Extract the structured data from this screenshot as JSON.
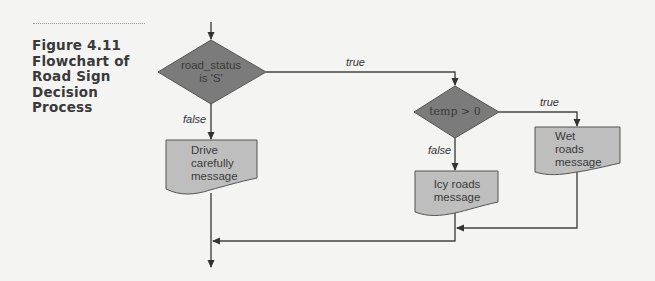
{
  "figure": {
    "caption_lines": [
      "Figure 4.11",
      "Flowchart of",
      "Road Sign",
      "Decision",
      "Process"
    ]
  },
  "colors": {
    "background": "#f4f4f3",
    "decision_fill": "#7b7b7b",
    "message_fill": "#bebebe",
    "line": "#444444",
    "text": "#3a3a3a"
  },
  "nodes": {
    "decision1": {
      "line1": "road_status",
      "line2": "is 'S'"
    },
    "decision2": {
      "text": "temp > 0"
    },
    "drive": {
      "line1": "Drive",
      "line2": "carefully",
      "line3": "message"
    },
    "icy": {
      "line1": "Icy roads",
      "line2": "message"
    },
    "wet": {
      "line1": "Wet",
      "line2": "roads",
      "line3": "message"
    }
  },
  "edges": {
    "d1_true": "true",
    "d1_false": "false",
    "d2_true": "true",
    "d2_false": "false"
  }
}
